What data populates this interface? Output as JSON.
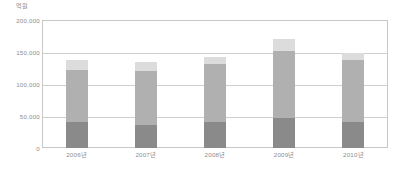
{
  "chart_data": {
    "type": "bar",
    "title": "",
    "subtitle": "",
    "xlabel": "",
    "ylabel": "",
    "unit_label": "억원",
    "stacked": true,
    "grid": true,
    "legend_position": "none",
    "categories": [
      "2006년",
      "2007년",
      "2008년",
      "2009년",
      "2010년"
    ],
    "ylim": [
      0,
      200000
    ],
    "yticks": [
      {
        "value": 200000,
        "label": "200,000"
      },
      {
        "value": 150000,
        "label": "150,000"
      },
      {
        "value": 100000,
        "label": "100,000"
      },
      {
        "value": 50000,
        "label": "50,000"
      },
      {
        "value": 0,
        "label": "0"
      }
    ],
    "series": [
      {
        "name": "series-1",
        "color": "#8a8a8a",
        "values": [
          40000,
          36000,
          41000,
          47000,
          40000
        ]
      },
      {
        "name": "series-2",
        "color": "#b0b0b0",
        "values": [
          82000,
          84000,
          90000,
          105000,
          97000
        ]
      },
      {
        "name": "series-3",
        "color": "#dcdcdc",
        "values": [
          15000,
          15000,
          11000,
          18000,
          11000
        ]
      }
    ],
    "totals": [
      137000,
      135000,
      142000,
      170000,
      148000
    ]
  },
  "caption": {
    "text": ""
  }
}
